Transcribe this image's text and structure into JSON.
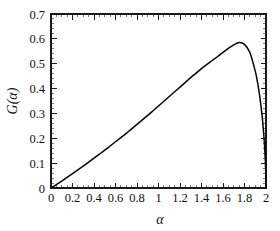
{
  "figure": {
    "background_color": "#ffffff",
    "curve_color": "#050505",
    "axis_color": "#1a1a1a",
    "xlabel": "α",
    "ylabel_prefix": "G",
    "ylabel_open": "(",
    "ylabel_arg": "α",
    "ylabel_close": ")"
  },
  "chart_data": {
    "type": "line",
    "title": "",
    "subtitle": "",
    "xlabel": "α",
    "ylabel": "G(α)",
    "xlim": [
      0,
      2
    ],
    "ylim": [
      0,
      0.7
    ],
    "grid": false,
    "legend": null,
    "xticks": [
      0,
      0.2,
      0.4,
      0.6,
      0.8,
      1,
      1.2,
      1.4,
      1.6,
      1.8,
      2
    ],
    "xtick_labels": [
      "0",
      "0.2",
      "0.4",
      "0.6",
      "0.8",
      "1",
      "1.2",
      "1.4",
      "1.6",
      "1.8",
      "2"
    ],
    "yticks": [
      0,
      0.1,
      0.2,
      0.3,
      0.4,
      0.5,
      0.6,
      0.7
    ],
    "ytick_labels": [
      "0",
      "0.1",
      "0.2",
      "0.3",
      "0.4",
      "0.5",
      "0.6",
      "0.7"
    ],
    "x_minor_per_major": 4,
    "y_minor_per_major": 5,
    "tick_direction": "in",
    "annotations": [],
    "series": [
      {
        "name": "G(α)",
        "color": "#050505",
        "peak_x": 1.75,
        "peak_y": 0.585,
        "x": [
          0,
          0.05,
          0.1,
          0.15,
          0.2,
          0.25,
          0.3,
          0.35,
          0.4,
          0.45,
          0.5,
          0.55,
          0.6,
          0.65,
          0.7,
          0.75,
          0.8,
          0.85,
          0.9,
          0.95,
          1,
          1.05,
          1.1,
          1.15,
          1.2,
          1.25,
          1.3,
          1.35,
          1.4,
          1.45,
          1.5,
          1.55,
          1.6,
          1.65,
          1.7,
          1.75,
          1.8,
          1.85,
          1.9,
          1.92,
          1.94,
          1.96,
          1.97,
          1.98,
          1.985,
          1.99,
          1.995,
          1.998,
          2
        ],
        "y": [
          0,
          0.014,
          0.028,
          0.043,
          0.058,
          0.073,
          0.088,
          0.104,
          0.12,
          0.136,
          0.152,
          0.169,
          0.186,
          0.203,
          0.22,
          0.238,
          0.256,
          0.274,
          0.292,
          0.311,
          0.33,
          0.349,
          0.368,
          0.387,
          0.406,
          0.425,
          0.444,
          0.462,
          0.48,
          0.497,
          0.513,
          0.529,
          0.546,
          0.562,
          0.576,
          0.585,
          0.578,
          0.545,
          0.47,
          0.428,
          0.375,
          0.305,
          0.262,
          0.21,
          0.178,
          0.142,
          0.095,
          0.05,
          0
        ]
      }
    ]
  }
}
